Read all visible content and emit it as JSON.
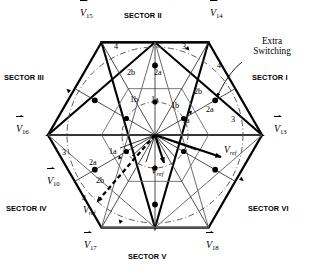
{
  "diagram": {
    "annotation": {
      "extra_switching": "Extra\nSwitching",
      "extra_switching_line1": "Extra",
      "extra_switching_line2": "Switching"
    },
    "sectors": [
      {
        "name": "sector-1",
        "label": "SECTOR I",
        "x": 252,
        "y": 78,
        "align": "left"
      },
      {
        "name": "sector-2",
        "label": "SECTOR II",
        "x": 156,
        "y": 16,
        "align": "center"
      },
      {
        "name": "sector-3",
        "label": "SECTOR III",
        "x": 46,
        "y": 78,
        "align": "right"
      },
      {
        "name": "sector-4",
        "label": "SECTOR IV",
        "x": 46,
        "y": 208,
        "align": "right"
      },
      {
        "name": "sector-5",
        "label": "SECTOR V",
        "x": 156,
        "y": 256,
        "align": "center"
      },
      {
        "name": "sector-6",
        "label": "SECTOR VI",
        "x": 252,
        "y": 208,
        "align": "left"
      }
    ],
    "vertex_vectors": [
      {
        "name": "vertex-v13",
        "symbol": "V",
        "sub": "13",
        "x": 274,
        "y": 130
      },
      {
        "name": "vertex-v14",
        "symbol": "V",
        "sub": "14",
        "x": 210,
        "y": 12
      },
      {
        "name": "vertex-v15",
        "symbol": "V",
        "sub": "15",
        "x": 86,
        "y": 12
      },
      {
        "name": "vertex-v16",
        "symbol": "V",
        "sub": "16",
        "x": 22,
        "y": 130
      },
      {
        "name": "vertex-v10",
        "symbol": "V",
        "sub": "10",
        "x": 52,
        "y": 182
      },
      {
        "name": "vertex-v17",
        "symbol": "V",
        "sub": "17",
        "x": 86,
        "y": 244
      },
      {
        "name": "vertex-v18",
        "symbol": "V",
        "sub": "18",
        "x": 208,
        "y": 244
      }
    ],
    "reference_vectors": [
      {
        "name": "vref-sector-vi",
        "symbol": "V",
        "sub": "ref",
        "x": 228,
        "y": 148,
        "style": "solid"
      },
      {
        "name": "vref-sector-v",
        "symbol": "V",
        "sub": "ref",
        "x": 152,
        "y": 172,
        "style": "solid"
      },
      {
        "name": "vref-sector-iv",
        "symbol": "V",
        "sub": "ref",
        "x": 84,
        "y": 218,
        "style": "dashed"
      }
    ],
    "region_labels": [
      {
        "name": "region-1a-s2",
        "text": "1a",
        "x": 155,
        "y": 100
      },
      {
        "name": "region-1b-s2",
        "text": "1b",
        "x": 134,
        "y": 100
      },
      {
        "name": "region-2a-s2",
        "text": "2a",
        "x": 158,
        "y": 73
      },
      {
        "name": "region-2b-s2",
        "text": "2b",
        "x": 131,
        "y": 73
      },
      {
        "name": "region-4-s2",
        "text": "4",
        "x": 116,
        "y": 47
      },
      {
        "name": "region-3-s2",
        "text": "3",
        "x": 184,
        "y": 47
      },
      {
        "name": "region-1a-s1",
        "text": "1a",
        "x": 186,
        "y": 121
      },
      {
        "name": "region-1b-s1",
        "text": "1b",
        "x": 175,
        "y": 106
      },
      {
        "name": "region-2a-s1",
        "text": "2a",
        "x": 210,
        "y": 110
      },
      {
        "name": "region-2b-s1",
        "text": "2b",
        "x": 198,
        "y": 92
      },
      {
        "name": "region-3-s1",
        "text": "3",
        "x": 233,
        "y": 120
      },
      {
        "name": "region-4-s1",
        "text": "4",
        "x": 219,
        "y": 66
      },
      {
        "name": "region-1a-s4",
        "text": "1a",
        "x": 113,
        "y": 152
      },
      {
        "name": "region-2a-s4",
        "text": "2a",
        "x": 93,
        "y": 163
      },
      {
        "name": "region-2b-s4",
        "text": "2b",
        "x": 100,
        "y": 181
      },
      {
        "name": "region-3-s4",
        "text": "3",
        "x": 64,
        "y": 153
      },
      {
        "name": "region-4-s4",
        "text": "4",
        "x": 84,
        "y": 199
      }
    ],
    "geometry": {
      "center_x": 155,
      "center_y": 135,
      "hexagon_radius": 107,
      "inner_circle_radius": 33,
      "outer_circle_radius": 88
    },
    "colors": {
      "stroke": "#000000",
      "background": "#ffffff",
      "thin_line": "#5a5a5a",
      "dashdot": "#555555"
    }
  }
}
